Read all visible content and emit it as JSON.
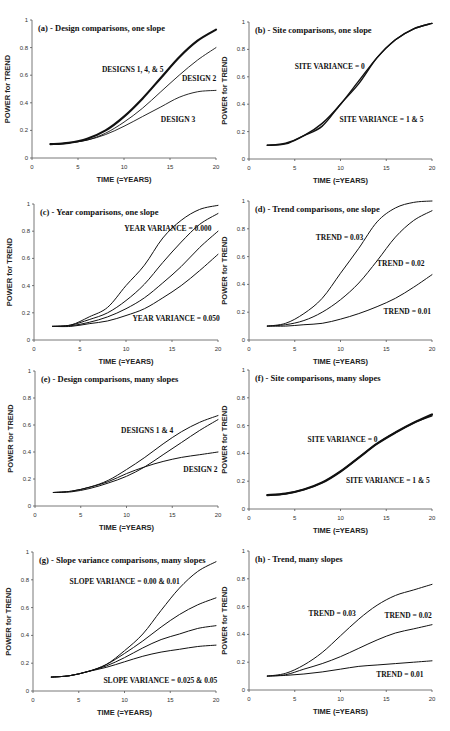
{
  "figure": {
    "background": "#ffffff",
    "line_color": "#111111"
  },
  "chart_data": [
    {
      "id": "a",
      "type": "line",
      "title": "(a) - Design comparisons, one slope",
      "xlabel": "TIME (=YEARS)",
      "ylabel": "POWER for TREND",
      "xlim": [
        0,
        20
      ],
      "ylim": [
        0,
        1
      ],
      "xticks": [
        0,
        5,
        10,
        15,
        20
      ],
      "yticks": [
        0,
        0.2,
        0.4,
        0.6,
        0.8,
        1
      ],
      "ytick_labels": [
        "0",
        "0.2",
        "0.4",
        "0.6",
        "0.8",
        "1"
      ],
      "grid": false,
      "legend": "none (inline annotations)",
      "x": [
        2,
        4,
        6,
        8,
        10,
        12,
        14,
        16,
        18,
        20
      ],
      "series": [
        {
          "name": "DESIGNS 1, 4, & 5",
          "values": [
            0.1,
            0.11,
            0.14,
            0.2,
            0.3,
            0.43,
            0.58,
            0.73,
            0.85,
            0.93
          ],
          "width": 2.2
        },
        {
          "name": "DESIGN 2",
          "values": [
            0.1,
            0.11,
            0.13,
            0.18,
            0.26,
            0.36,
            0.48,
            0.6,
            0.71,
            0.8
          ],
          "width": 0.9
        },
        {
          "name": "DESIGN 3",
          "values": [
            0.1,
            0.11,
            0.13,
            0.17,
            0.23,
            0.3,
            0.37,
            0.44,
            0.48,
            0.49
          ],
          "width": 0.9
        }
      ],
      "annotations": [
        {
          "text": "DESIGNS 1, 4, & 5",
          "x": 7.6,
          "y": 0.62
        },
        {
          "text": "DESIGN  2",
          "x": 16.3,
          "y": 0.56
        },
        {
          "text": "DESIGN 3",
          "x": 14.0,
          "y": 0.26
        }
      ]
    },
    {
      "id": "b",
      "type": "line",
      "title": "(b) - Site comparisons, one slope",
      "xlabel": "TIME (=YEARS)",
      "ylabel": "POWER for TREND",
      "xlim": [
        0,
        20
      ],
      "ylim": [
        0,
        1
      ],
      "xticks": [
        0,
        5,
        10,
        15,
        20
      ],
      "yticks": [
        0,
        0.2,
        0.4,
        0.6,
        0.8,
        1
      ],
      "ytick_labels": [
        "0",
        "0.2",
        "0.4",
        "0.6",
        "0.8",
        "1"
      ],
      "grid": false,
      "legend": "none (inline annotations)",
      "x": [
        2,
        4,
        6,
        8,
        10,
        12,
        14,
        16,
        18,
        20
      ],
      "series": [
        {
          "name": "SITE VARIANCE = 0",
          "values": [
            0.1,
            0.115,
            0.17,
            0.26,
            0.4,
            0.57,
            0.74,
            0.87,
            0.95,
            0.99
          ],
          "width": 1.4
        },
        {
          "name": "SITE VARIANCE = 1 & 5",
          "values": [
            0.1,
            0.11,
            0.17,
            0.24,
            0.4,
            0.55,
            0.74,
            0.87,
            0.95,
            0.99
          ],
          "width": 1.4
        }
      ],
      "annotations": [
        {
          "text": "SITE VARIANCE = 0",
          "x": 5.0,
          "y": 0.66
        },
        {
          "text": "SITE VARIANCE = 1 & 5",
          "x": 9.9,
          "y": 0.27
        }
      ]
    },
    {
      "id": "c",
      "type": "line",
      "title": "(c) - Year comparisons, one slope",
      "xlabel": "TIME (=YEARS)",
      "ylabel": "POWER for TREND",
      "xlim": [
        0,
        20
      ],
      "ylim": [
        0,
        1
      ],
      "xticks": [
        0,
        5,
        10,
        15,
        20
      ],
      "yticks": [
        0,
        0.2,
        0.4,
        0.6,
        0.8,
        1
      ],
      "ytick_labels": [
        "0",
        "0.2",
        "0.4",
        "0.6",
        "0.8",
        "1"
      ],
      "grid": false,
      "legend": "none (inline annotations)",
      "x": [
        2,
        4,
        6,
        8,
        10,
        12,
        14,
        16,
        18,
        20
      ],
      "series": [
        {
          "name": "YEAR VARIANCE = 0.000",
          "values": [
            0.1,
            0.11,
            0.17,
            0.24,
            0.4,
            0.55,
            0.75,
            0.88,
            0.96,
            0.99
          ],
          "width": 1.0
        },
        {
          "name": "YEAR VARIANCE (intermediate 1)",
          "values": [
            0.1,
            0.11,
            0.15,
            0.2,
            0.29,
            0.41,
            0.57,
            0.72,
            0.85,
            0.93
          ],
          "width": 1.0
        },
        {
          "name": "YEAR VARIANCE (intermediate 2)",
          "values": [
            0.1,
            0.105,
            0.13,
            0.17,
            0.23,
            0.31,
            0.42,
            0.54,
            0.68,
            0.8
          ],
          "width": 1.0
        },
        {
          "name": "YEAR VARIANCE = 0.050",
          "values": [
            0.1,
            0.1,
            0.12,
            0.14,
            0.18,
            0.23,
            0.31,
            0.4,
            0.51,
            0.63
          ],
          "width": 1.0
        }
      ],
      "annotations": [
        {
          "text": "YEAR VARIANCE = 0.000",
          "x": 9.8,
          "y": 0.8
        },
        {
          "text": "YEAR VARIANCE = 0.050",
          "x": 10.7,
          "y": 0.14
        }
      ]
    },
    {
      "id": "d",
      "type": "line",
      "title": "(d) - Trend comparisons, one slope",
      "xlabel": "TIME (=YEARS)",
      "ylabel": "POWER for TREND",
      "xlim": [
        0,
        20
      ],
      "ylim": [
        0,
        1
      ],
      "xticks": [
        0,
        5,
        10,
        15,
        20
      ],
      "yticks": [
        0,
        0.2,
        0.4,
        0.6,
        0.8,
        1
      ],
      "ytick_labels": [
        "0",
        "0.2",
        "0.4",
        "0.6",
        "0.8",
        "1"
      ],
      "grid": false,
      "legend": "none (inline annotations)",
      "x": [
        2,
        4,
        6,
        8,
        10,
        12,
        14,
        16,
        18,
        20
      ],
      "series": [
        {
          "name": "TREND = 0.03",
          "values": [
            0.1,
            0.12,
            0.19,
            0.3,
            0.48,
            0.66,
            0.85,
            0.95,
            0.99,
            1.0
          ],
          "width": 1.0
        },
        {
          "name": "TREND = 0.02",
          "values": [
            0.1,
            0.11,
            0.14,
            0.2,
            0.29,
            0.41,
            0.57,
            0.74,
            0.86,
            0.93
          ],
          "width": 1.0
        },
        {
          "name": "TREND = 0.01",
          "values": [
            0.1,
            0.1,
            0.11,
            0.12,
            0.15,
            0.19,
            0.24,
            0.3,
            0.38,
            0.47
          ],
          "width": 1.0
        }
      ],
      "annotations": [
        {
          "text": "TREND = 0.03",
          "x": 7.3,
          "y": 0.72
        },
        {
          "text": "TREND = 0.02",
          "x": 14.0,
          "y": 0.53
        },
        {
          "text": "TREND = 0.01",
          "x": 14.7,
          "y": 0.19
        }
      ]
    },
    {
      "id": "e",
      "type": "line",
      "title": "(e)  - Design comparisons, many slopes",
      "xlabel": "TIME (=YEARS)",
      "ylabel": "POWER for TREND",
      "xlim": [
        0,
        20
      ],
      "ylim": [
        0,
        1
      ],
      "xticks": [
        0,
        5,
        10,
        15,
        20
      ],
      "yticks": [
        0,
        0.2,
        0.4,
        0.6,
        0.8,
        1
      ],
      "ytick_labels": [
        "0",
        "0.2",
        "0.4",
        "0.6",
        "0.8",
        "1"
      ],
      "grid": false,
      "legend": "none (inline annotations)",
      "x": [
        2,
        4,
        6,
        8,
        10,
        12,
        14,
        16,
        18,
        20
      ],
      "series": [
        {
          "name": "DESIGNS 1 & 4 (upper)",
          "values": [
            0.1,
            0.11,
            0.14,
            0.19,
            0.27,
            0.36,
            0.46,
            0.55,
            0.62,
            0.67
          ],
          "width": 1.0
        },
        {
          "name": "DESIGNS 1 & 4 (lower)",
          "values": [
            0.1,
            0.105,
            0.13,
            0.17,
            0.22,
            0.29,
            0.38,
            0.47,
            0.56,
            0.64
          ],
          "width": 1.0
        },
        {
          "name": "DESIGN  2",
          "values": [
            0.1,
            0.11,
            0.14,
            0.18,
            0.24,
            0.29,
            0.33,
            0.36,
            0.38,
            0.4
          ],
          "width": 1.0
        }
      ],
      "annotations": [
        {
          "text": "DESIGNS 1 & 4",
          "x": 9.4,
          "y": 0.54
        },
        {
          "text": "DESIGN  2",
          "x": 16.2,
          "y": 0.25
        }
      ]
    },
    {
      "id": "f",
      "type": "line",
      "title": "(f) - Site comparisons, many slopes",
      "xlabel": "TIME (=YEARS)",
      "ylabel": "POWER for TREND",
      "xlim": [
        0,
        20
      ],
      "ylim": [
        0,
        1
      ],
      "xticks": [
        0,
        5,
        10,
        15,
        20
      ],
      "yticks": [
        0,
        0.2,
        0.4,
        0.6,
        0.8,
        1
      ],
      "ytick_labels": [
        "0",
        "0.2",
        "0.4",
        "0.6",
        "0.8",
        "1"
      ],
      "grid": false,
      "legend": "none (inline annotations)",
      "x": [
        2,
        4,
        6,
        8,
        10,
        12,
        14,
        16,
        18,
        20
      ],
      "series": [
        {
          "name": "SITE VARIANCE = 0",
          "values": [
            0.1,
            0.11,
            0.14,
            0.19,
            0.27,
            0.37,
            0.47,
            0.55,
            0.62,
            0.68
          ],
          "width": 2.2
        },
        {
          "name": "SITE VARIANCE = 1 & 5",
          "values": [
            0.1,
            0.11,
            0.14,
            0.19,
            0.27,
            0.37,
            0.47,
            0.55,
            0.62,
            0.67
          ],
          "width": 1.4
        }
      ],
      "annotations": [
        {
          "text": "SITE VARIANCE = 0",
          "x": 6.4,
          "y": 0.48
        },
        {
          "text": "SITE VARIANCE = 1 & 5",
          "x": 10.6,
          "y": 0.19
        }
      ]
    },
    {
      "id": "g",
      "type": "line",
      "title": "(g) - Slope variance comparisons, many slopes",
      "xlabel": "TIME (=YEARS)",
      "ylabel": "POWER for TREND",
      "xlim": [
        0,
        20
      ],
      "ylim": [
        0,
        1
      ],
      "xticks": [
        0,
        5,
        10,
        15,
        20
      ],
      "yticks": [
        0,
        0.2,
        0.4,
        0.6,
        0.8,
        1
      ],
      "ytick_labels": [
        "0",
        "0.2",
        "0.4",
        "0.6",
        "0.8",
        "1"
      ],
      "grid": false,
      "legend": "none (inline annotations)",
      "x": [
        2,
        4,
        6,
        8,
        10,
        12,
        14,
        16,
        18,
        20
      ],
      "series": [
        {
          "name": "SLOPE VARIANCE = 0.00",
          "values": [
            0.1,
            0.11,
            0.14,
            0.19,
            0.29,
            0.41,
            0.58,
            0.74,
            0.86,
            0.93
          ],
          "width": 1.0
        },
        {
          "name": "SLOPE VARIANCE = 0.01",
          "values": [
            0.1,
            0.11,
            0.14,
            0.19,
            0.27,
            0.36,
            0.46,
            0.55,
            0.62,
            0.67
          ],
          "width": 1.0
        },
        {
          "name": "SLOPE VARIANCE = 0.025",
          "values": [
            0.1,
            0.11,
            0.14,
            0.18,
            0.24,
            0.31,
            0.37,
            0.41,
            0.45,
            0.47
          ],
          "width": 1.0
        },
        {
          "name": "SLOPE VARIANCE = 0.05",
          "values": [
            0.1,
            0.11,
            0.14,
            0.17,
            0.21,
            0.25,
            0.28,
            0.3,
            0.32,
            0.33
          ],
          "width": 1.0
        }
      ],
      "annotations": [
        {
          "text": "SLOPE VARIANCE = 0.00 & 0.01",
          "x": 4.0,
          "y": 0.77
        },
        {
          "text": "SLOPE VARIANCE = 0.025 & 0.05",
          "x": 7.7,
          "y": 0.06
        }
      ]
    },
    {
      "id": "h",
      "type": "line",
      "title": "(h) - Trend, many slopes",
      "xlabel": "TIME (=YEARS)",
      "ylabel": "POWER for TREND",
      "xlim": [
        0,
        20
      ],
      "ylim": [
        0,
        1
      ],
      "xticks": [
        0,
        5,
        10,
        15,
        20
      ],
      "yticks": [
        0,
        0.2,
        0.4,
        0.6,
        0.8,
        1
      ],
      "ytick_labels": [
        "0",
        "0.2",
        "0.4",
        "0.6",
        "0.8",
        "1"
      ],
      "grid": false,
      "legend": "none (inline annotations)",
      "x": [
        2,
        4,
        6,
        8,
        10,
        12,
        14,
        16,
        18,
        20
      ],
      "series": [
        {
          "name": "TREND = 0.03",
          "values": [
            0.1,
            0.12,
            0.18,
            0.27,
            0.39,
            0.51,
            0.61,
            0.68,
            0.72,
            0.76
          ],
          "width": 1.0
        },
        {
          "name": "TREND = 0.02",
          "values": [
            0.1,
            0.11,
            0.15,
            0.19,
            0.24,
            0.3,
            0.36,
            0.41,
            0.44,
            0.47
          ],
          "width": 1.0
        },
        {
          "name": "TREND = 0.01",
          "values": [
            0.1,
            0.105,
            0.115,
            0.13,
            0.15,
            0.17,
            0.18,
            0.19,
            0.2,
            0.21
          ],
          "width": 1.0
        }
      ],
      "annotations": [
        {
          "text": "TREND = 0.03",
          "x": 6.5,
          "y": 0.53
        },
        {
          "text": "TREND = 0.02",
          "x": 14.8,
          "y": 0.52
        },
        {
          "text": "TREND = 0.01",
          "x": 13.9,
          "y": 0.09
        }
      ]
    }
  ],
  "layout": [
    {
      "id": "a",
      "x0": 32,
      "x1": 216,
      "y0": 158,
      "y1": 20
    },
    {
      "id": "b",
      "x0": 249,
      "x1": 432,
      "y0": 159,
      "y1": 22
    },
    {
      "id": "c",
      "x0": 34,
      "x1": 218,
      "y0": 340,
      "y1": 204
    },
    {
      "id": "d",
      "x0": 249,
      "x1": 432,
      "y0": 340,
      "y1": 201
    },
    {
      "id": "e",
      "x0": 35,
      "x1": 218,
      "y0": 506,
      "y1": 371
    },
    {
      "id": "f",
      "x0": 249,
      "x1": 432,
      "y0": 509,
      "y1": 370
    },
    {
      "id": "g",
      "x0": 33,
      "x1": 216,
      "y0": 691,
      "y1": 552
    },
    {
      "id": "h",
      "x0": 249,
      "x1": 432,
      "y0": 690,
      "y1": 551
    }
  ]
}
